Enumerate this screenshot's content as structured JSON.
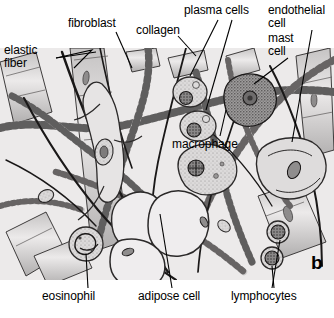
{
  "figure": {
    "panel_letter": "b",
    "background_color": "#ffffff",
    "panel_fill_color": "#eceaea",
    "ink_color": "#000000",
    "width": 334,
    "height": 318
  },
  "labels": [
    {
      "id": "elastic-fiber",
      "text": "elastic\nfiber",
      "line1": "elastic",
      "line2": "fiber",
      "x": 4,
      "y": 46,
      "leader": true
    },
    {
      "id": "fibroblast",
      "text": "fibroblast",
      "line1": "fibroblast",
      "line2": "",
      "x": 68,
      "y": 18,
      "leader": true
    },
    {
      "id": "collagen",
      "text": "collagen",
      "line1": "collagen",
      "line2": "",
      "x": 136,
      "y": 25,
      "leader": true
    },
    {
      "id": "plasma-cells",
      "text": "plasma cells",
      "line1": "plasma cells",
      "line2": "",
      "x": 186,
      "y": 6,
      "leader": true
    },
    {
      "id": "endothelial-cell",
      "text": "endothelial\ncell",
      "line1": "endothelial",
      "line2": "cell",
      "x": 268,
      "y": 6,
      "leader": true
    },
    {
      "id": "mast-cell",
      "text": "mast\ncell",
      "line1": "mast",
      "line2": "cell",
      "x": 268,
      "y": 34,
      "leader": true
    },
    {
      "id": "macrophage",
      "text": "macrophage",
      "line1": "macrophage",
      "line2": "",
      "x": 176,
      "y": 140,
      "leader": true
    },
    {
      "id": "eosinophil",
      "text": "eosinophil",
      "line1": "eosinophil",
      "line2": "",
      "x": 44,
      "y": 292,
      "leader": true
    },
    {
      "id": "adipose-cell",
      "text": "adipose cell",
      "line1": "adipose cell",
      "line2": "",
      "x": 140,
      "y": 292,
      "leader": true
    },
    {
      "id": "lymphocytes",
      "text": "lymphocytes",
      "line1": "lymphocytes",
      "line2": "",
      "x": 233,
      "y": 292,
      "leader": true
    }
  ],
  "structures": {
    "collagen_bundles": "banded thick fiber bundles",
    "elastic_fibers": "thin dark branching fibers",
    "adipose_cells": 3,
    "plasma_cells": 2,
    "lymphocytes": 2,
    "mast_cells": 1,
    "macrophages": 1,
    "eosinophils": 1,
    "fibroblasts": 1,
    "endothelial_cells": 1
  }
}
